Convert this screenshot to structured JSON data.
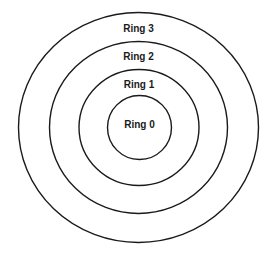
{
  "diagram": {
    "type": "concentric-rings",
    "center": {
      "x": 138.5,
      "y": 127.5
    },
    "stroke_color": "#1a1a1a",
    "background": "#ffffff",
    "rings": [
      {
        "label": "Ring 0",
        "rx": 32,
        "ry": 32,
        "label_y": 128
      },
      {
        "label": "Ring 1",
        "rx": 60,
        "ry": 58,
        "label_y": 88
      },
      {
        "label": "Ring 2",
        "rx": 89,
        "ry": 86,
        "label_y": 60
      },
      {
        "label": "Ring 3",
        "rx": 120,
        "ry": 115,
        "label_y": 32
      }
    ]
  }
}
